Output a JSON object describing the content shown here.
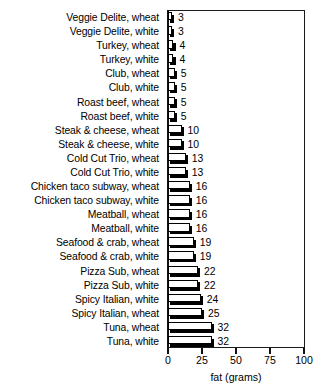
{
  "chart_data": {
    "type": "bar",
    "orientation": "horizontal",
    "title": "",
    "xlabel": "fat (grams)",
    "ylabel": "",
    "xlim": [
      0,
      100
    ],
    "xticks": [
      0,
      25,
      50,
      75,
      100
    ],
    "xtick_labels": [
      "0",
      "25",
      "50",
      "75",
      "100"
    ],
    "grid": false,
    "legend": null,
    "show_value_labels": true,
    "categories": [
      "Veggie Delite, wheat",
      "Veggie Delite, white",
      "Turkey, wheat",
      "Turkey, white",
      "Club, wheat",
      "Club, white",
      "Roast beef, wheat",
      "Roast beef, white",
      "Steak & cheese, wheat",
      "Steak & cheese, white",
      "Cold Cut Trio, wheat",
      "Cold Cut Trio, white",
      "Chicken taco subway, wheat",
      "Chicken taco subway, white",
      "Meatball, wheat",
      "Meatball, white",
      "Seafood & crab, wheat",
      "Seafood & crab, white",
      "Pizza Sub, wheat",
      "Pizza Sub, white",
      "Spicy Italian, white",
      "Spicy Italian, wheat",
      "Tuna, wheat",
      "Tuna, white"
    ],
    "values": [
      3,
      3,
      4,
      4,
      5,
      5,
      5,
      5,
      10,
      10,
      13,
      13,
      16,
      16,
      16,
      16,
      19,
      19,
      22,
      22,
      24,
      25,
      32,
      32
    ],
    "value_labels": [
      "3",
      "3",
      "4",
      "4",
      "5",
      "5",
      "5",
      "5",
      "10",
      "10",
      "13",
      "13",
      "16",
      "16",
      "16",
      "16",
      "19",
      "19",
      "22",
      "22",
      "24",
      "25",
      "32",
      "32"
    ],
    "colors": {
      "bar_fill": "#ffffff",
      "bar_edge": "#000000",
      "bar_shadow": "#000000",
      "axis": "#111111",
      "text": "#000000",
      "background": "#ffffff"
    }
  }
}
